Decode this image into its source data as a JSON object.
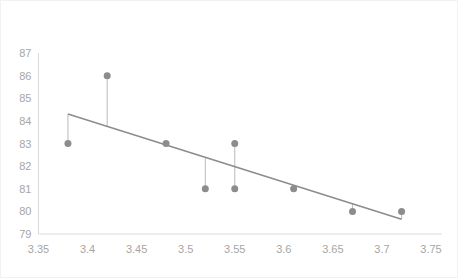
{
  "chart_data": {
    "type": "scatter",
    "title": "",
    "subtitle": "",
    "xlabel": "",
    "ylabel": "",
    "xlim": [
      3.35,
      3.75
    ],
    "ylim": [
      79,
      87
    ],
    "x_ticks": [
      "3.35",
      "3.4",
      "3.45",
      "3.5",
      "3.55",
      "3.6",
      "3.65",
      "3.7",
      "3.75"
    ],
    "x_tick_values": [
      3.35,
      3.4,
      3.45,
      3.5,
      3.55,
      3.6,
      3.65,
      3.7,
      3.75
    ],
    "y_ticks": [
      "87",
      "86",
      "85",
      "84",
      "83",
      "82",
      "81",
      "80",
      "79"
    ],
    "y_tick_values": [
      87,
      86,
      85,
      84,
      83,
      82,
      81,
      80,
      79
    ],
    "grid": false,
    "legend": "none",
    "points": [
      {
        "x": 3.38,
        "y": 83
      },
      {
        "x": 3.42,
        "y": 86
      },
      {
        "x": 3.48,
        "y": 83
      },
      {
        "x": 3.52,
        "y": 81
      },
      {
        "x": 3.55,
        "y": 83
      },
      {
        "x": 3.55,
        "y": 81
      },
      {
        "x": 3.61,
        "y": 81
      },
      {
        "x": 3.67,
        "y": 80
      },
      {
        "x": 3.72,
        "y": 80
      }
    ],
    "series": [
      {
        "name": "Observations",
        "type": "scatter",
        "x": [
          3.38,
          3.42,
          3.48,
          3.52,
          3.55,
          3.55,
          3.61,
          3.67,
          3.72
        ],
        "values": [
          83,
          86,
          83,
          81,
          83,
          81,
          81,
          80,
          80
        ],
        "color": "#8c8c8c",
        "marker_size": 7
      },
      {
        "name": "Trendline",
        "type": "line",
        "x": [
          3.38,
          3.72
        ],
        "values": [
          84.3,
          79.65
        ],
        "color": "#8c8c8c",
        "line_width": 1.6
      }
    ],
    "residual_lines": [
      {
        "x": 3.38,
        "y_point": 83,
        "y_fit": 84.3
      },
      {
        "x": 3.42,
        "y_point": 86,
        "y_fit": 83.75
      },
      {
        "x": 3.48,
        "y_point": 83,
        "y_fit": 82.93
      },
      {
        "x": 3.52,
        "y_point": 81,
        "y_fit": 82.38
      },
      {
        "x": 3.55,
        "y_point": 83,
        "y_fit": 81.97
      },
      {
        "x": 3.55,
        "y_point": 81,
        "y_fit": 81.97
      },
      {
        "x": 3.61,
        "y_point": 81,
        "y_fit": 81.15
      },
      {
        "x": 3.67,
        "y_point": 80,
        "y_fit": 80.33
      },
      {
        "x": 3.72,
        "y_point": 80,
        "y_fit": 79.65
      }
    ],
    "colors": {
      "marker": "#8c8c8c",
      "trendline": "#8c8c8c",
      "residual": "#bfbfbf",
      "axis": "#d9d9d9",
      "tick_text": "#a6a6a6",
      "background": "#ffffff",
      "border": "#f2f2f2"
    }
  }
}
